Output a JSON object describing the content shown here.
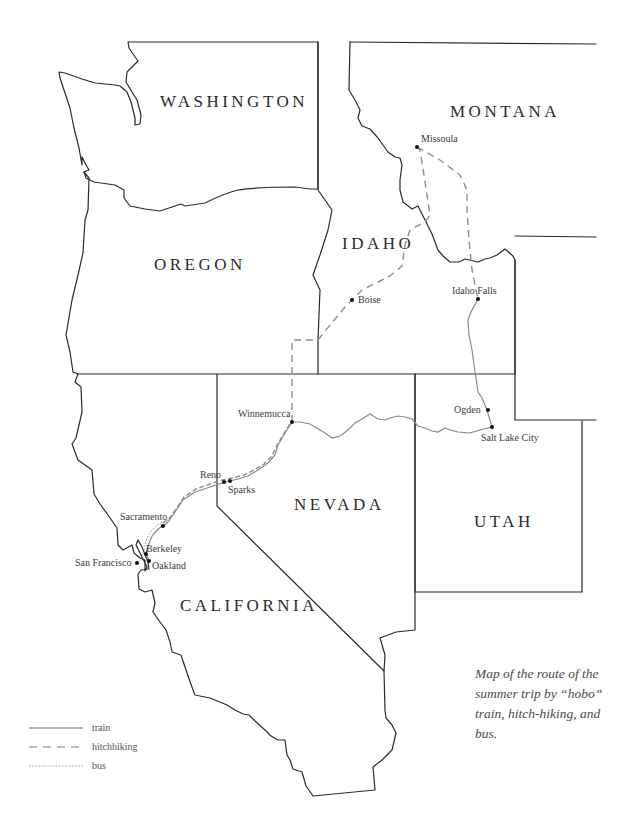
{
  "map": {
    "states": [
      {
        "name": "WASHINGTON",
        "x": 160,
        "y": 107
      },
      {
        "name": "MONTANA",
        "x": 450,
        "y": 116
      },
      {
        "name": "OREGON",
        "x": 154,
        "y": 270
      },
      {
        "name": "IDAHO",
        "x": 342,
        "y": 247
      },
      {
        "name": "NEVADA",
        "x": 294,
        "y": 510
      },
      {
        "name": "UTAH",
        "x": 474,
        "y": 527
      },
      {
        "name": "CALIFORNIA",
        "x": 180,
        "y": 611
      }
    ],
    "cities": [
      {
        "name": "Missoula",
        "dot": [
          417,
          147
        ],
        "label": [
          420,
          142
        ],
        "anchor": "start"
      },
      {
        "name": "Boise",
        "dot": [
          352,
          300
        ],
        "label": [
          358,
          303
        ],
        "anchor": "start"
      },
      {
        "name": "Idaho Falls",
        "dot": [
          478,
          299
        ],
        "label": [
          452,
          294
        ],
        "anchor": "start"
      },
      {
        "name": "Ogden",
        "dot": [
          488,
          410
        ],
        "label": [
          454,
          413
        ],
        "anchor": "start"
      },
      {
        "name": "Salt Lake City",
        "dot": [
          492,
          427
        ],
        "label": [
          481,
          441
        ],
        "anchor": "start"
      },
      {
        "name": "Winnemucca",
        "dot": [
          292,
          422
        ],
        "label": [
          238,
          417
        ],
        "anchor": "start"
      },
      {
        "name": "Reno",
        "dot": [
          224,
          482
        ],
        "label": [
          200,
          478
        ],
        "anchor": "start"
      },
      {
        "name": "Sparks",
        "dot": [
          230,
          481
        ],
        "label": [
          228,
          493
        ],
        "anchor": "start"
      },
      {
        "name": "Sacramento",
        "dot": [
          163,
          526
        ],
        "label": [
          120,
          520
        ],
        "anchor": "start"
      },
      {
        "name": "Berkeley",
        "dot": [
          146,
          553
        ],
        "label": [
          146,
          552
        ],
        "anchor": "start"
      },
      {
        "name": "Oakland",
        "dot": [
          149,
          561
        ],
        "label": [
          152,
          569
        ],
        "anchor": "start"
      },
      {
        "name": "San Francisco",
        "dot": [
          137,
          562
        ],
        "label": [
          75,
          566
        ],
        "anchor": "start"
      }
    ]
  },
  "legend": {
    "train": "train",
    "hitchhiking": "hitchhiking",
    "bus": "bus"
  },
  "caption": "Map of the route of the summer trip by “hobo” train, hitch-hiking, and bus."
}
